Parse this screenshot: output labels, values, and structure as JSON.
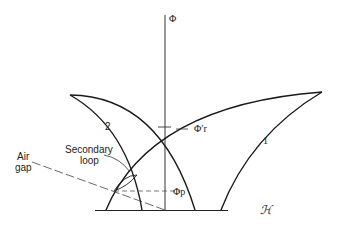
{
  "diagram": {
    "type": "magnetization-loop-diagram",
    "axes": {
      "vertical_label": "Φ",
      "horizontal_label": "ℋ"
    },
    "curves": [
      {
        "id": "1",
        "label": "1"
      },
      {
        "id": "2",
        "label": "2"
      }
    ],
    "annotations": {
      "phi_r": "Φ′r",
      "phi_p": "Φp",
      "secondary_loop": [
        "Secondary",
        "loop"
      ],
      "air_gap": [
        "Air",
        "gap"
      ]
    },
    "colors": {
      "line": "#1a1a1a",
      "dashed": "#555555",
      "background": "#ffffff"
    }
  }
}
